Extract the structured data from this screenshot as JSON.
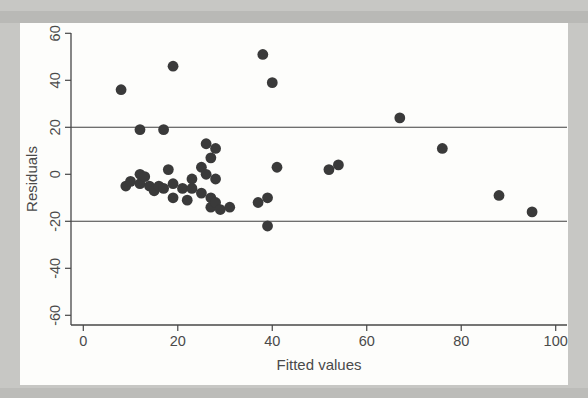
{
  "figure": {
    "xlabel": "Fitted values",
    "ylabel": "Residuals"
  },
  "colors": {
    "page_background": "#c7c7c4",
    "figure_background": "#fdfdfb",
    "axis_color": "#474747",
    "text_color": "#4a4a4a",
    "point_color": "#3a3a3a",
    "reference_line_color": "#3f3f3f"
  },
  "chart_data": {
    "type": "scatter",
    "title": "",
    "xlabel": "Fitted values",
    "ylabel": "Residuals",
    "xlim": [
      -3,
      102.5
    ],
    "ylim": [
      -64,
      60.5
    ],
    "x_ticks": [
      0,
      20,
      40,
      60,
      80,
      100
    ],
    "y_ticks": [
      60,
      40,
      20,
      0,
      -20,
      -40,
      -60
    ],
    "grid": false,
    "legend": "none",
    "reference_lines_y": [
      20,
      -20
    ],
    "marker": "filled-circle",
    "points": [
      [
        8,
        36
      ],
      [
        9,
        -5
      ],
      [
        10,
        -3
      ],
      [
        12,
        19
      ],
      [
        12,
        0
      ],
      [
        12,
        -4
      ],
      [
        13,
        -1
      ],
      [
        14,
        -5
      ],
      [
        15,
        -7
      ],
      [
        16,
        -5
      ],
      [
        17,
        19
      ],
      [
        17,
        -6
      ],
      [
        18,
        2
      ],
      [
        19,
        46
      ],
      [
        19,
        -4
      ],
      [
        19,
        -10
      ],
      [
        21,
        -6
      ],
      [
        22,
        -11
      ],
      [
        23,
        -2
      ],
      [
        23,
        -6
      ],
      [
        25,
        3
      ],
      [
        25,
        -8
      ],
      [
        26,
        13
      ],
      [
        26,
        0
      ],
      [
        27,
        7
      ],
      [
        27,
        -10
      ],
      [
        27,
        -14
      ],
      [
        28,
        11
      ],
      [
        28,
        -2
      ],
      [
        28,
        -12
      ],
      [
        29,
        -15
      ],
      [
        31,
        -14
      ],
      [
        37,
        -12
      ],
      [
        38,
        51
      ],
      [
        39,
        -10
      ],
      [
        39,
        -22
      ],
      [
        40,
        39
      ],
      [
        41,
        3
      ],
      [
        52,
        2
      ],
      [
        54,
        4
      ],
      [
        67,
        24
      ],
      [
        76,
        11
      ],
      [
        88,
        -9
      ],
      [
        95,
        -16
      ]
    ]
  }
}
